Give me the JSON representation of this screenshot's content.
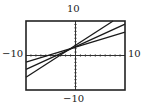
{
  "chart_data": {
    "type": "line",
    "title": "",
    "xlabel": "",
    "ylabel": "",
    "xlim": [
      -10,
      10
    ],
    "ylim": [
      -10,
      10
    ],
    "grid": false,
    "axis_ticks": "unit tick marks along both axes",
    "window_labels": {
      "top": "10",
      "bottom": "-10",
      "left": "-10",
      "right": "10"
    },
    "series": [
      {
        "name": "line-1",
        "slope": 0.44,
        "intercept": 2.45,
        "x": [
          -10,
          10
        ],
        "y": [
          -1.9,
          6.8
        ]
      },
      {
        "name": "line-2",
        "slope": 0.66,
        "intercept": 2.55,
        "x": [
          -10,
          10
        ],
        "y": [
          -4.0,
          9.1
        ]
      },
      {
        "name": "line-3",
        "slope": 0.93,
        "intercept": 2.95,
        "x": [
          -10,
          7.6
        ],
        "y": [
          -6.3,
          10
        ]
      }
    ]
  },
  "labels": {
    "top": "10",
    "bottom": "−10",
    "left": "−10",
    "right": "10"
  },
  "colors": {
    "line": "#1a1a1a",
    "frame": "#222222",
    "background": "#ffffff"
  }
}
